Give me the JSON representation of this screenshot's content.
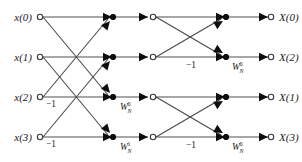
{
  "figure": {
    "name": "4-point-fft-butterfly-signal-flow-graph",
    "type": "signal-flow-graph",
    "stages": 2,
    "points": 4,
    "colors": {
      "edge_straight": "#8a8a8a",
      "edge_cross": "#4a4a4a",
      "node_open_fill": "#ffffff",
      "node_open_stroke": "#3a3a3a",
      "node_filled": "#0d0d0d",
      "text": "#1a1a1a",
      "background": "#ffffff"
    }
  },
  "inputs": [
    {
      "label": "x(0)",
      "row": 0
    },
    {
      "label": "x(1)",
      "row": 1
    },
    {
      "label": "x(2)",
      "row": 2
    },
    {
      "label": "x(3)",
      "row": 3
    }
  ],
  "outputs": [
    {
      "label": "X(0)",
      "row": 0
    },
    {
      "label": "X(2)",
      "row": 1
    },
    {
      "label": "X(1)",
      "row": 2
    },
    {
      "label": "X(3)",
      "row": 3
    }
  ],
  "stage1": {
    "negative_labels": [
      {
        "text": "−1",
        "row": 2
      },
      {
        "text": "−1",
        "row": 3
      }
    ],
    "twiddles": [
      {
        "base": "W",
        "sub": "N",
        "sup": "0",
        "row": 2
      },
      {
        "base": "W",
        "sub": "N",
        "sup": "1",
        "row": 3
      }
    ]
  },
  "stage2": {
    "negative_labels": [
      {
        "text": "−1",
        "row": 1
      },
      {
        "text": "−1",
        "row": 3
      }
    ],
    "twiddles": [
      {
        "base": "W",
        "sub": "N",
        "sup": "0",
        "row": 1
      },
      {
        "base": "W",
        "sub": "N",
        "sup": "0",
        "row": 3
      }
    ]
  }
}
